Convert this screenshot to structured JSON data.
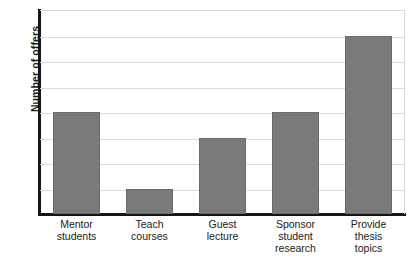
{
  "chart_data": {
    "type": "bar",
    "title": "",
    "xlabel": "",
    "ylabel": "Number of offers",
    "categories": [
      "Mentor\nstudents",
      "Teach\ncourses",
      "Guest\nlecture",
      "Sponsor\nstudent\nresearch",
      "Provide\nthesis\ntopics"
    ],
    "values": [
      4,
      1,
      3,
      4,
      7
    ],
    "ylim": [
      0,
      8
    ],
    "yticks": [
      "0",
      "1",
      "2",
      "3",
      "4",
      "5",
      "6",
      "7",
      "8"
    ],
    "grid": "horizontal",
    "legend": "none",
    "orientation": "vertical"
  },
  "style": {
    "bar_color": "#7a7a7a",
    "bar_border_color": "#6a6a6a",
    "grid_color": "#dcdcdc",
    "axis_color": "#161616",
    "plot_border_color": "#d9d9d9",
    "text_color": "#1a1a1a",
    "background": "#ffffff"
  },
  "footer": {
    "caption": ""
  }
}
